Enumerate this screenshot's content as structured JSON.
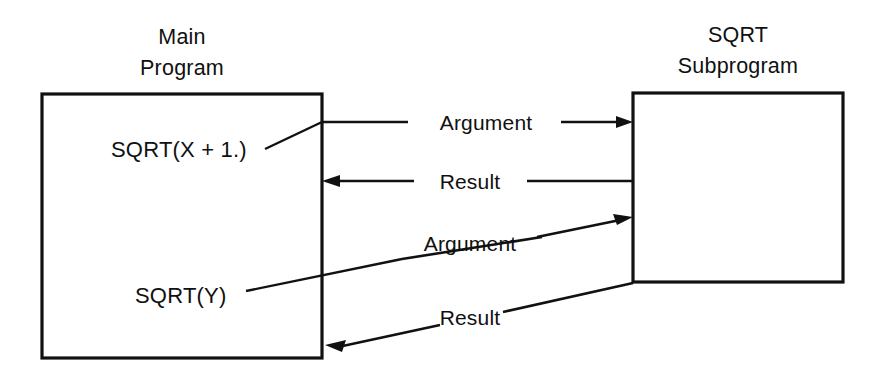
{
  "diagram": {
    "title_main": "Main\nProgram",
    "boxes": [
      {
        "id": "main-program",
        "label_line1": "Main",
        "label_line2": "Program",
        "contents": [
          {
            "id": "call-1",
            "text": "SQRT(X + 1.)"
          },
          {
            "id": "call-2",
            "text": "SQRT(Y)"
          }
        ]
      },
      {
        "id": "sqrt-subprogram",
        "label_line1": "SQRT",
        "label_line2": "Subprogram",
        "contents": []
      }
    ],
    "flows": [
      {
        "id": "flow-1",
        "label": "Argument",
        "direction": "to-subprogram",
        "call": "SQRT(X + 1.)"
      },
      {
        "id": "flow-2",
        "label": "Result",
        "direction": "to-main",
        "call": "SQRT(X + 1.)"
      },
      {
        "id": "flow-3",
        "label": "Argument",
        "direction": "to-subprogram",
        "call": "SQRT(Y)"
      },
      {
        "id": "flow-4",
        "label": "Result",
        "direction": "to-main",
        "call": "SQRT(Y)"
      }
    ],
    "colors": {
      "stroke": "#111111",
      "text": "#101010",
      "background": "#ffffff"
    }
  }
}
